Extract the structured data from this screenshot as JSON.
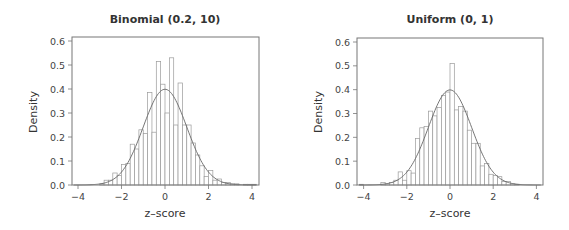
{
  "chart_data": [
    {
      "type": "bar",
      "subtype": "histogram_with_normal_density",
      "title": "Binomial (0.2, 10)",
      "xlabel": "z–score",
      "ylabel": "Density",
      "xlim": [
        -4.3,
        4.3
      ],
      "ylim": [
        0,
        0.62
      ],
      "xticks": [
        -4,
        -2,
        0,
        2,
        4
      ],
      "xtick_labels": [
        "−4",
        "−2",
        "0",
        "2",
        "4"
      ],
      "yticks": [
        0.0,
        0.1,
        0.2,
        0.3,
        0.4,
        0.5,
        0.6
      ],
      "ytick_labels": [
        "0.0",
        "0.1",
        "0.2",
        "0.3",
        "0.4",
        "0.5",
        "0.6"
      ],
      "grid": false,
      "bin_width": 0.2,
      "bin_centers": [
        -2.9,
        -2.7,
        -2.5,
        -2.3,
        -2.1,
        -1.9,
        -1.7,
        -1.5,
        -1.3,
        -1.1,
        -0.9,
        -0.7,
        -0.5,
        -0.3,
        -0.1,
        0.1,
        0.3,
        0.5,
        0.7,
        0.9,
        1.1,
        1.3,
        1.5,
        1.7,
        1.9,
        2.1,
        2.3,
        2.5,
        2.7,
        2.9,
        3.1,
        3.3,
        3.5,
        3.7,
        3.9,
        4.1
      ],
      "values": [
        0.005,
        0.02,
        0.02,
        0.05,
        0.04,
        0.085,
        0.09,
        0.17,
        0.15,
        0.23,
        0.215,
        0.385,
        0.22,
        0.515,
        0.42,
        0.3,
        0.53,
        0.25,
        0.425,
        0.25,
        0.25,
        0.175,
        0.125,
        0.08,
        0.035,
        0.06,
        0.02,
        0.025,
        0.01,
        0.01,
        0.005,
        0.005,
        0.0,
        0.003,
        0.003,
        0.003
      ],
      "overlay": {
        "type": "line",
        "name": "Standard normal density",
        "mean": 0,
        "sd": 1,
        "peak": 0.399
      }
    },
    {
      "type": "bar",
      "subtype": "histogram_with_normal_density",
      "title": "Uniform (0, 1)",
      "xlabel": "z–score",
      "ylabel": "Density",
      "xlim": [
        -4.3,
        4.3
      ],
      "ylim": [
        0,
        0.62
      ],
      "xticks": [
        -4,
        -2,
        0,
        2,
        4
      ],
      "xtick_labels": [
        "−4",
        "−2",
        "0",
        "2",
        "4"
      ],
      "yticks": [
        0.0,
        0.1,
        0.2,
        0.3,
        0.4,
        0.5,
        0.6
      ],
      "ytick_labels": [
        "0.0",
        "0.1",
        "0.2",
        "0.3",
        "0.4",
        "0.5",
        "0.6"
      ],
      "grid": false,
      "bin_width": 0.2,
      "bin_centers": [
        -4.1,
        -3.9,
        -3.7,
        -3.5,
        -3.3,
        -3.1,
        -2.9,
        -2.7,
        -2.5,
        -2.3,
        -2.1,
        -1.9,
        -1.7,
        -1.5,
        -1.3,
        -1.1,
        -0.9,
        -0.7,
        -0.5,
        -0.3,
        -0.1,
        0.1,
        0.3,
        0.5,
        0.7,
        0.9,
        1.1,
        1.3,
        1.5,
        1.7,
        1.9,
        2.1,
        2.3,
        2.5,
        2.7,
        2.9,
        3.1
      ],
      "values": [
        0.003,
        0.0,
        0.0,
        0.0,
        0.0,
        0.01,
        0.005,
        0.01,
        0.02,
        0.055,
        0.02,
        0.06,
        0.05,
        0.195,
        0.24,
        0.245,
        0.31,
        0.29,
        0.325,
        0.375,
        0.39,
        0.51,
        0.315,
        0.33,
        0.31,
        0.23,
        0.175,
        0.175,
        0.08,
        0.09,
        0.045,
        0.04,
        0.035,
        0.015,
        0.015,
        0.005,
        0.003
      ],
      "overlay": {
        "type": "line",
        "name": "Standard normal density",
        "mean": 0,
        "sd": 1,
        "peak": 0.399
      }
    }
  ],
  "panels": [
    {
      "title": "Binomial (0.2, 10)",
      "xlabel": "z–score",
      "ylabel": "Density"
    },
    {
      "title": "Uniform (0, 1)",
      "xlabel": "z–score",
      "ylabel": "Density"
    }
  ]
}
